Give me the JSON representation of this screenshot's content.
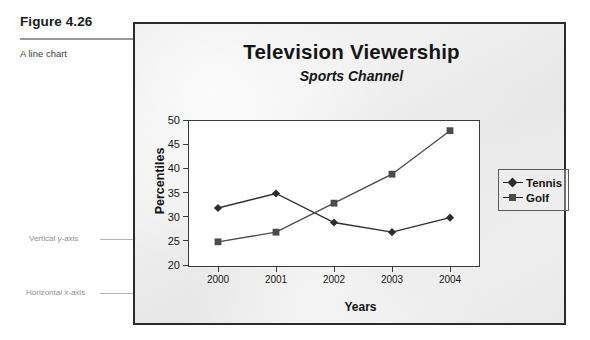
{
  "caption": {
    "figure_number": "Figure 4.26",
    "description": "A line chart"
  },
  "annotations": {
    "y_axis": {
      "prefix": "Vertical ",
      "emphasis": "y",
      "suffix": "-axis"
    },
    "x_axis": {
      "prefix": "Horizontal ",
      "emphasis": "x",
      "suffix": "-axis"
    }
  },
  "legend": {
    "position": "right",
    "items": [
      {
        "label": "Tennis",
        "marker": "diamond",
        "color": "#2e2e2e"
      },
      {
        "label": "Golf",
        "marker": "square",
        "color": "#4b4b4b"
      }
    ]
  },
  "chart_data": {
    "type": "line",
    "title": "Television Viewership",
    "subtitle": "Sports Channel",
    "xlabel": "Years",
    "ylabel": "Percentiles",
    "categories": [
      "2000",
      "2001",
      "2002",
      "2003",
      "2004"
    ],
    "ylim": [
      20,
      50
    ],
    "yticks": [
      50,
      45,
      40,
      35,
      30,
      25,
      20
    ],
    "grid": false,
    "series": [
      {
        "name": "Tennis",
        "marker": "diamond",
        "color": "#2e2e2e",
        "values": [
          32,
          35,
          29,
          27,
          30
        ]
      },
      {
        "name": "Golf",
        "marker": "square",
        "color": "#4b4b4b",
        "values": [
          25,
          27,
          33,
          39,
          48
        ]
      }
    ]
  }
}
